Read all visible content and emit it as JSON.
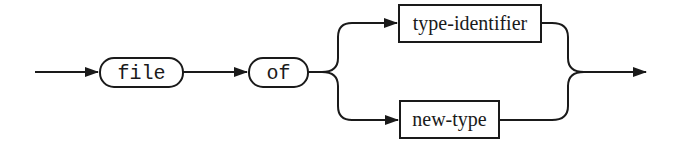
{
  "diagram": {
    "type": "syntax-diagram",
    "terminals": [
      {
        "label": "file"
      },
      {
        "label": "of"
      }
    ],
    "nonterminals": [
      {
        "label": "type-identifier"
      },
      {
        "label": "new-type"
      }
    ],
    "colors": {
      "stroke": "#1a1a1a",
      "background": "#ffffff"
    }
  }
}
